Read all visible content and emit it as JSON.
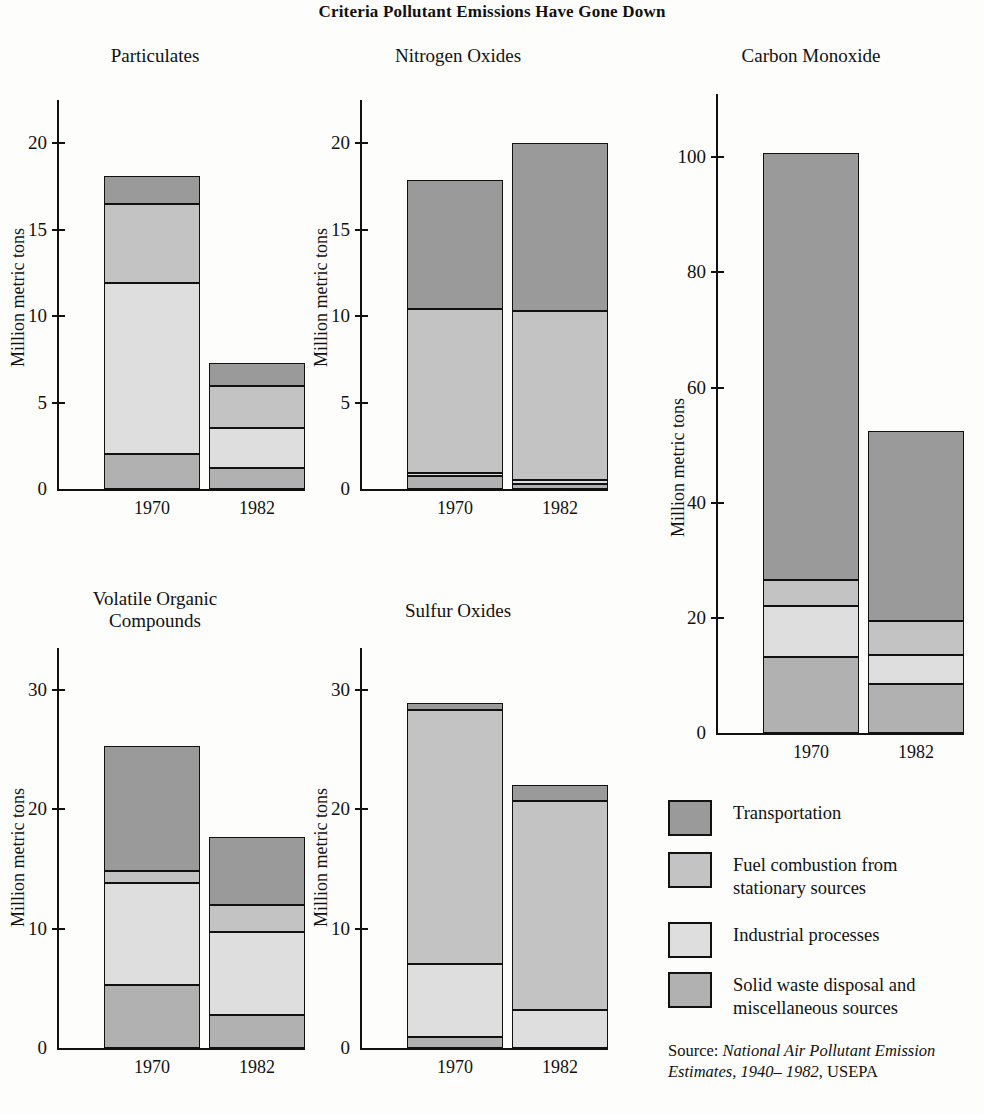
{
  "title": "Criteria Pollutant Emissions Have Gone Down",
  "common": {
    "ylabel": "Million metric tons",
    "categories": [
      "1970",
      "1982"
    ]
  },
  "series_names": [
    "Transportation",
    "Fuel combustion from\nstationary sources",
    "Industrial processes",
    "Solid waste disposal and\nmiscellaneous sources"
  ],
  "colors": {
    "transportation": "#9a9a9a",
    "fuel_combustion": "#c3c3c3",
    "industrial": "#dedede",
    "solid_waste": "#b1b1b1",
    "axis": "#111111"
  },
  "legend": {
    "items": [
      {
        "label": "Transportation",
        "color_key": "transportation"
      },
      {
        "label": "Fuel combustion from\nstationary sources",
        "color_key": "fuel_combustion"
      },
      {
        "label": "Industrial processes",
        "color_key": "industrial"
      },
      {
        "label": "Solid waste disposal and\nmiscellaneous sources",
        "color_key": "solid_waste"
      }
    ]
  },
  "source": {
    "prefix": "Source: ",
    "italic": "National Air Pollutant Emission Estimates, 1940– 1982",
    "suffix": ", USEPA"
  },
  "panels": [
    {
      "key": "particulates",
      "title": "Particulates",
      "ylabel": "Million metric tons",
      "ticks": [
        0,
        5,
        10,
        15,
        20
      ],
      "ymax": 20,
      "axis_top_value": 22.5,
      "bars": [
        {
          "category": "1970",
          "total": 18.1,
          "segments": [
            {
              "name": "Solid waste disposal and miscellaneous sources",
              "value": 2.05
            },
            {
              "name": "Industrial processes",
              "value": 9.85
            },
            {
              "name": "Fuel combustion from stationary sources",
              "value": 4.6
            },
            {
              "name": "Transportation",
              "value": 1.6
            }
          ]
        },
        {
          "category": "1982",
          "total": 7.3,
          "segments": [
            {
              "name": "Solid waste disposal and miscellaneous sources",
              "value": 1.2
            },
            {
              "name": "Industrial processes",
              "value": 2.35
            },
            {
              "name": "Fuel combustion from stationary sources",
              "value": 2.4
            },
            {
              "name": "Transportation",
              "value": 1.35
            }
          ]
        }
      ]
    },
    {
      "key": "nitrogen_oxides",
      "title": "Nitrogen Oxides",
      "ylabel": "Million metric tons",
      "ticks": [
        0,
        5,
        10,
        15,
        20
      ],
      "ymax": 20,
      "axis_top_value": 22.5,
      "bars": [
        {
          "category": "1970",
          "total": 17.9,
          "segments": [
            {
              "name": "Solid waste disposal and miscellaneous sources",
              "value": 0.75
            },
            {
              "name": "Industrial processes",
              "value": 0.2
            },
            {
              "name": "Fuel combustion from stationary sources",
              "value": 9.45
            },
            {
              "name": "Transportation",
              "value": 7.5
            }
          ]
        },
        {
          "category": "1982",
          "total": 20.0,
          "segments": [
            {
              "name": "Solid waste disposal and miscellaneous sources",
              "value": 0.3
            },
            {
              "name": "Industrial processes",
              "value": 0.2
            },
            {
              "name": "Fuel combustion from stationary sources",
              "value": 9.8
            },
            {
              "name": "Transportation",
              "value": 9.7
            }
          ]
        }
      ]
    },
    {
      "key": "carbon_monoxide",
      "title": "Carbon Monoxide",
      "ylabel": "Million metric tons",
      "ticks": [
        0,
        20,
        40,
        60,
        80,
        100
      ],
      "ymax": 100,
      "axis_top_value": 111,
      "bars": [
        {
          "category": "1970",
          "total": 100.8,
          "segments": [
            {
              "name": "Solid waste disposal and miscellaneous sources",
              "value": 13.2
            },
            {
              "name": "Industrial processes",
              "value": 8.8
            },
            {
              "name": "Fuel combustion from stationary sources",
              "value": 4.5
            },
            {
              "name": "Transportation",
              "value": 74.3
            }
          ]
        },
        {
          "category": "1982",
          "total": 52.5,
          "segments": [
            {
              "name": "Solid waste disposal and miscellaneous sources",
              "value": 8.5
            },
            {
              "name": "Industrial processes",
              "value": 5.0
            },
            {
              "name": "Fuel combustion from stationary sources",
              "value": 6.0
            },
            {
              "name": "Transportation",
              "value": 33.0
            }
          ]
        }
      ]
    },
    {
      "key": "volatile_organic_compounds",
      "title": "Volatile Organic\nCompounds",
      "ylabel": "Million metric tons",
      "ticks": [
        0,
        10,
        20,
        30
      ],
      "ymax": 30,
      "axis_top_value": 33.5,
      "bars": [
        {
          "category": "1970",
          "total": 25.3,
          "segments": [
            {
              "name": "Solid waste disposal and miscellaneous sources",
              "value": 5.3
            },
            {
              "name": "Industrial processes",
              "value": 8.5
            },
            {
              "name": "Fuel combustion from stationary sources",
              "value": 1.0
            },
            {
              "name": "Transportation",
              "value": 10.5
            }
          ]
        },
        {
          "category": "1982",
          "total": 17.7,
          "segments": [
            {
              "name": "Solid waste disposal and miscellaneous sources",
              "value": 2.8
            },
            {
              "name": "Industrial processes",
              "value": 6.9
            },
            {
              "name": "Fuel combustion from stationary sources",
              "value": 2.3
            },
            {
              "name": "Transportation",
              "value": 5.7
            }
          ]
        }
      ]
    },
    {
      "key": "sulfur_oxides",
      "title": "Sulfur Oxides",
      "ylabel": "Million metric tons",
      "ticks": [
        0,
        10,
        20,
        30
      ],
      "ymax": 30,
      "axis_top_value": 33.5,
      "bars": [
        {
          "category": "1970",
          "total": 28.9,
          "segments": [
            {
              "name": "Solid waste disposal and miscellaneous sources",
              "value": 0.9
            },
            {
              "name": "Industrial processes",
              "value": 6.1
            },
            {
              "name": "Fuel combustion from stationary sources",
              "value": 21.3
            },
            {
              "name": "Transportation",
              "value": 0.6
            }
          ]
        },
        {
          "category": "1982",
          "total": 22.0,
          "segments": [
            {
              "name": "Solid waste disposal and miscellaneous sources",
              "value": 0
            },
            {
              "name": "Industrial processes",
              "value": 3.2
            },
            {
              "name": "Fuel combustion from stationary sources",
              "value": 17.5
            },
            {
              "name": "Transportation",
              "value": 1.3
            }
          ]
        }
      ]
    }
  ],
  "chart_data": {
    "type": "bar",
    "title": "Criteria Pollutant Emissions Have Gone Down",
    "subtitle": "",
    "xlabel": "",
    "ylabel": "Million metric tons",
    "grid": false,
    "legend_position": "right-bottom",
    "stacked": true,
    "categories": [
      "1970",
      "1982"
    ],
    "legend_entries": [
      "Transportation",
      "Fuel combustion from stationary sources",
      "Industrial processes",
      "Solid waste disposal and miscellaneous sources"
    ],
    "panels": [
      {
        "name": "Particulates",
        "ylim": [
          0,
          20
        ],
        "yticks": [
          0,
          5,
          10,
          15,
          20
        ],
        "series": [
          {
            "name": "Transportation",
            "values": [
              1.6,
              1.35
            ]
          },
          {
            "name": "Fuel combustion from stationary sources",
            "values": [
              4.6,
              2.4
            ]
          },
          {
            "name": "Industrial processes",
            "values": [
              9.85,
              2.35
            ]
          },
          {
            "name": "Solid waste disposal and miscellaneous sources",
            "values": [
              2.05,
              1.2
            ]
          }
        ],
        "totals": [
          18.1,
          7.3
        ]
      },
      {
        "name": "Nitrogen Oxides",
        "ylim": [
          0,
          20
        ],
        "yticks": [
          0,
          5,
          10,
          15,
          20
        ],
        "series": [
          {
            "name": "Transportation",
            "values": [
              7.5,
              9.7
            ]
          },
          {
            "name": "Fuel combustion from stationary sources",
            "values": [
              9.45,
              9.8
            ]
          },
          {
            "name": "Industrial processes",
            "values": [
              0.2,
              0.2
            ]
          },
          {
            "name": "Solid waste disposal and miscellaneous sources",
            "values": [
              0.75,
              0.3
            ]
          }
        ],
        "totals": [
          17.9,
          20.0
        ]
      },
      {
        "name": "Carbon Monoxide",
        "ylim": [
          0,
          100
        ],
        "yticks": [
          0,
          20,
          40,
          60,
          80,
          100
        ],
        "series": [
          {
            "name": "Transportation",
            "values": [
              74.3,
              33.0
            ]
          },
          {
            "name": "Fuel combustion from stationary sources",
            "values": [
              4.5,
              6.0
            ]
          },
          {
            "name": "Industrial processes",
            "values": [
              8.8,
              5.0
            ]
          },
          {
            "name": "Solid waste disposal and miscellaneous sources",
            "values": [
              13.2,
              8.5
            ]
          }
        ],
        "totals": [
          100.8,
          52.5
        ]
      },
      {
        "name": "Volatile Organic Compounds",
        "ylim": [
          0,
          30
        ],
        "yticks": [
          0,
          10,
          20,
          30
        ],
        "series": [
          {
            "name": "Transportation",
            "values": [
              10.5,
              5.7
            ]
          },
          {
            "name": "Fuel combustion from stationary sources",
            "values": [
              1.0,
              2.3
            ]
          },
          {
            "name": "Industrial processes",
            "values": [
              8.5,
              6.9
            ]
          },
          {
            "name": "Solid waste disposal and miscellaneous sources",
            "values": [
              5.3,
              2.8
            ]
          }
        ],
        "totals": [
          25.3,
          17.7
        ]
      },
      {
        "name": "Sulfur Oxides",
        "ylim": [
          0,
          30
        ],
        "yticks": [
          0,
          10,
          20,
          30
        ],
        "series": [
          {
            "name": "Transportation",
            "values": [
              0.6,
              1.3
            ]
          },
          {
            "name": "Fuel combustion from stationary sources",
            "values": [
              21.3,
              17.5
            ]
          },
          {
            "name": "Industrial processes",
            "values": [
              6.1,
              3.2
            ]
          },
          {
            "name": "Solid waste disposal and miscellaneous sources",
            "values": [
              0.9,
              0
            ]
          }
        ],
        "totals": [
          28.9,
          22.0
        ]
      }
    ],
    "source": "Source: National Air Pollutant Emission Estimates, 1940–1982, USEPA"
  }
}
